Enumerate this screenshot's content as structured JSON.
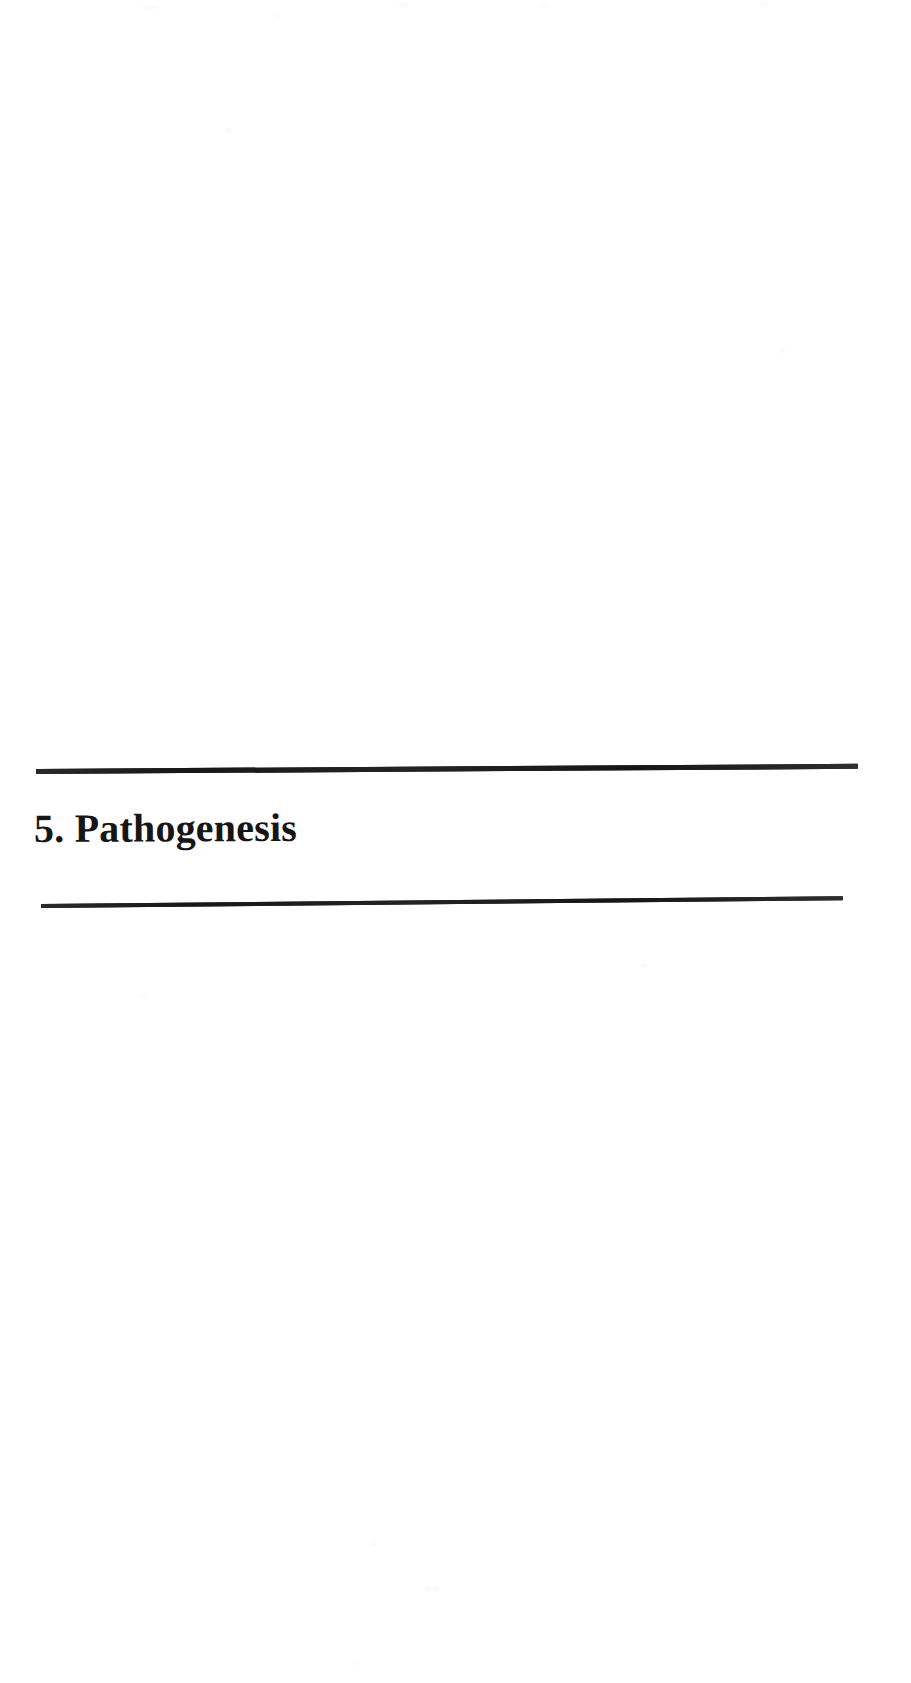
{
  "page": {
    "background_color": "#ffffff",
    "ink_color": "#1c1c1c",
    "width_px": 911,
    "height_px": 1683,
    "kind": "scanned-book-page"
  },
  "section": {
    "number": "5.",
    "title": "Pathogenesis",
    "heading_text": "5. Pathogenesis",
    "rules": {
      "top": {
        "name": "top-divider-rule",
        "thickness_px": 5,
        "color": "#1c1c1c"
      },
      "bottom": {
        "name": "bottom-divider-rule",
        "thickness_px": 3,
        "color": "#1c1c1c"
      }
    }
  },
  "artifacts": {
    "description": "faint scanner dust and speckle",
    "color": "#fafafa"
  }
}
